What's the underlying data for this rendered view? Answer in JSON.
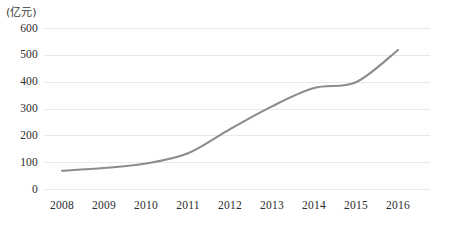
{
  "chart_data": {
    "type": "line",
    "title": "",
    "xlabel": "",
    "ylabel": "(亿元)",
    "unit_label": "(亿元)",
    "categories": [
      "2008",
      "2009",
      "2010",
      "2011",
      "2012",
      "2013",
      "2014",
      "2015",
      "2016"
    ],
    "values": [
      70,
      80,
      97,
      135,
      225,
      310,
      378,
      400,
      520
    ],
    "series": [
      {
        "name": "",
        "values": [
          70,
          80,
          97,
          135,
          225,
          310,
          378,
          400,
          520
        ]
      }
    ],
    "ylim": [
      0,
      600
    ],
    "yticks": [
      0,
      100,
      200,
      300,
      400,
      500,
      600
    ],
    "ytick_labels": [
      "0",
      "100",
      "200",
      "300",
      "400",
      "500",
      "600"
    ],
    "grid": "horizontal",
    "legend": "none",
    "line_color": "#8c8c8c",
    "gridline_color": "#e9e9e9",
    "background_color": "#ffffff"
  }
}
